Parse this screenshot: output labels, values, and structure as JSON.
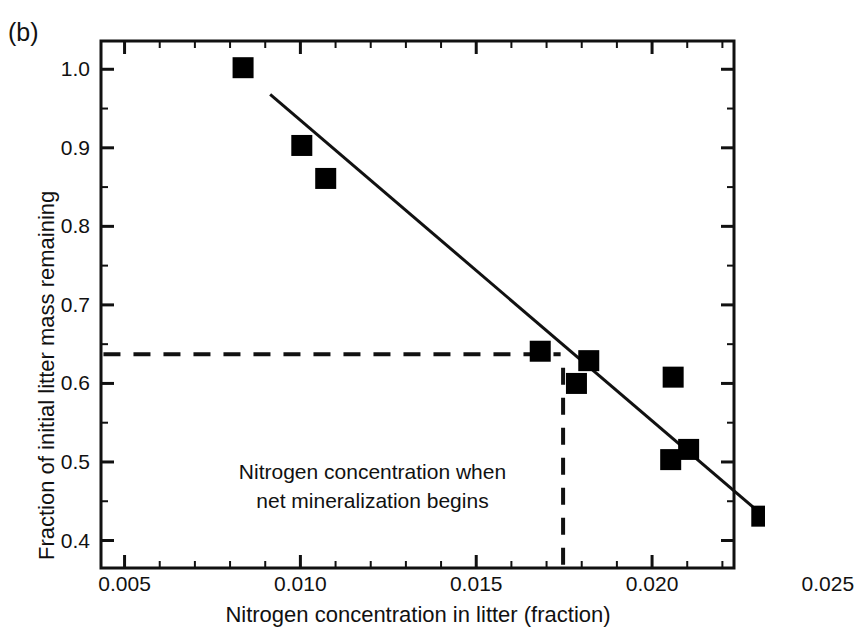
{
  "figure": {
    "panel_label": "(b)",
    "background": "#ffffff",
    "ink_color": "#111111"
  },
  "chart_data": {
    "type": "scatter",
    "title": "",
    "xlabel": "Nitrogen concentration in litter (fraction)",
    "ylabel": "Fraction of initial litter mass remaining",
    "xlim": [
      0.00433,
      0.02233
    ],
    "ylim": [
      0.365,
      1.036
    ],
    "xticks": [
      0.005,
      0.01,
      0.015,
      0.02,
      0.025
    ],
    "xtick_labels": [
      "0.005",
      "0.010",
      "0.015",
      "0.020",
      "0.025"
    ],
    "xminor_step": 0.001,
    "yticks": [
      0.4,
      0.5,
      0.6,
      0.7,
      0.8,
      0.9,
      1.0
    ],
    "ytick_labels": [
      "0.4",
      "0.5",
      "0.6",
      "0.7",
      "0.8",
      "0.9",
      "1.0"
    ],
    "yminor_step": 0.05,
    "grid": false,
    "legend": null,
    "marker": "square",
    "marker_color": "#000000",
    "points": [
      {
        "x": 0.00837,
        "y": 1.002
      },
      {
        "x": 0.01004,
        "y": 0.903
      },
      {
        "x": 0.01072,
        "y": 0.861
      },
      {
        "x": 0.01682,
        "y": 0.641
      },
      {
        "x": 0.0182,
        "y": 0.629
      },
      {
        "x": 0.01785,
        "y": 0.6
      },
      {
        "x": 0.0206,
        "y": 0.608
      },
      {
        "x": 0.02104,
        "y": 0.516
      },
      {
        "x": 0.02053,
        "y": 0.503
      },
      {
        "x": 0.02312,
        "y": 0.431
      }
    ],
    "fit_line": {
      "label": "regression line",
      "x0": 0.00914,
      "y0": 0.968,
      "x1": 0.0232,
      "y1": 0.43
    },
    "reference_lines": [
      {
        "name": "horizontal-threshold",
        "orientation": "horizontal",
        "value": 0.637,
        "style": "dashed",
        "x_from": 0.0044,
        "x_to": 0.0174
      },
      {
        "name": "vertical-threshold",
        "orientation": "vertical",
        "value": 0.01747,
        "style": "dashed",
        "y_from": 0.62,
        "y_to": 0.368
      }
    ],
    "annotations": [
      {
        "name": "mineralization-note",
        "line1": "Nitrogen concentration when",
        "line2": "net mineralization begins",
        "x": 0.01205,
        "y": 0.468
      }
    ]
  }
}
